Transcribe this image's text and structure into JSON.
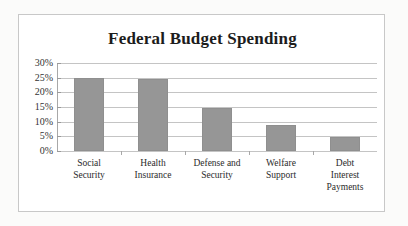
{
  "chart_data": {
    "type": "bar",
    "title": "Federal Budget Spending",
    "xlabel": "",
    "ylabel": "",
    "ylim": [
      0,
      30
    ],
    "ytick_labels": [
      "30%",
      "25%",
      "20%",
      "15%",
      "10%",
      "5%",
      "0%"
    ],
    "ytick_values": [
      30,
      25,
      20,
      15,
      10,
      5,
      0
    ],
    "grid": true,
    "legend": "none",
    "categories": [
      "Social Security",
      "Health Insurance",
      "Defense and Security",
      "Welfare Support",
      "Debt Interest Payments"
    ],
    "category_lines": [
      [
        "Social",
        "Security"
      ],
      [
        "Health",
        "Insurance"
      ],
      [
        "Defense and",
        "Security"
      ],
      [
        "Welfare",
        "Support"
      ],
      [
        "Debt",
        "Interest",
        "Payments"
      ]
    ],
    "values": [
      25,
      24.7,
      14.5,
      9,
      4.8
    ],
    "bar_color": "#969696",
    "gridline_color": "#c4c4c4",
    "axis_color": "#a8a8a8",
    "frame_color": "#c8c8c8",
    "background_color": "#ffffff"
  }
}
